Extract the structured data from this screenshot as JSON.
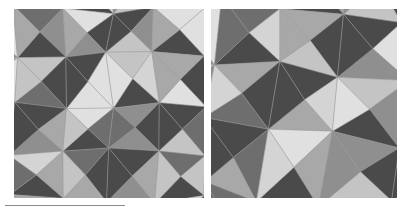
{
  "figure": {
    "title": "",
    "caption": "",
    "background_color": "#ffffff",
    "rule": {
      "name": "horizontal-rule",
      "color": "#8a8a8a",
      "x": 5,
      "y": 205,
      "width": 120,
      "thickness": 1
    }
  },
  "palette": {
    "dark": "#4a4a4a",
    "mid_dark": "#6e6e6e",
    "mid": "#8f8f8f",
    "mid_light": "#a8a8a8",
    "light": "#c4c4c4",
    "lighter": "#d4d4d4",
    "lightest": "#e0e0e0",
    "stroke": "#9a9a9a",
    "panel_bg": "#b4b4b4"
  },
  "panels": [
    {
      "id": "panel-left",
      "label": "left-tessellation",
      "x": 14,
      "y": 9,
      "width": 190,
      "height": 189,
      "cell_size": 47.5,
      "cols": 4,
      "rows": 4,
      "rotation_deg": 0,
      "description": "Triangular pinwheel tessellation, fine scale"
    },
    {
      "id": "panel-right",
      "label": "right-tessellation",
      "x": 211,
      "y": 9,
      "width": 186,
      "height": 189,
      "cell_size": 63,
      "cols": 3,
      "rows": 3,
      "rotation_deg": 6,
      "description": "Triangular pinwheel tessellation, coarse scale, slightly rotated"
    }
  ],
  "chart_data": {
    "type": "heatmap",
    "title": "",
    "xlabel": "",
    "ylabel": "",
    "legend": [],
    "note": "Two grayscale triangular tessellations rendered as vector polygons",
    "shade_levels": [
      0,
      1,
      2,
      3,
      4,
      5,
      6
    ],
    "shade_hex": [
      "#4a4a4a",
      "#6e6e6e",
      "#8f8f8f",
      "#a8a8a8",
      "#c4c4c4",
      "#d4d4d4",
      "#e0e0e0"
    ],
    "left_panel_shades": [
      [
        0,
        4,
        2,
        0,
        5,
        3,
        1,
        4
      ],
      [
        3,
        0,
        5,
        2,
        0,
        6,
        4,
        0
      ],
      [
        5,
        2,
        0,
        4,
        3,
        0,
        2,
        5
      ],
      [
        0,
        6,
        3,
        0,
        5,
        2,
        0,
        3
      ],
      [
        4,
        0,
        2,
        5,
        0,
        4,
        6,
        0
      ],
      [
        2,
        5,
        0,
        3,
        6,
        0,
        3,
        4
      ],
      [
        0,
        3,
        5,
        0,
        2,
        5,
        0,
        6
      ],
      [
        6,
        0,
        4,
        2,
        0,
        3,
        5,
        0
      ]
    ],
    "right_panel_shades": [
      [
        0,
        5,
        3,
        0,
        4,
        2
      ],
      [
        4,
        0,
        6,
        3,
        0,
        5
      ],
      [
        2,
        3,
        0,
        5,
        6,
        0
      ],
      [
        0,
        6,
        4,
        0,
        3,
        5
      ],
      [
        5,
        0,
        2,
        6,
        0,
        4
      ],
      [
        3,
        4,
        0,
        2,
        5,
        0
      ]
    ]
  }
}
